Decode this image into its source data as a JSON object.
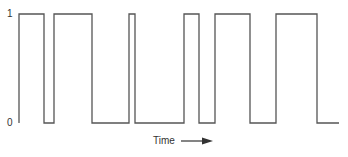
{
  "diagram": {
    "title": "",
    "y_labels": {
      "high": "1",
      "low": "0"
    },
    "x_label": "Time",
    "arrow": "right-arrow",
    "line_color": "#555555",
    "high_y": 14,
    "low_y": 123,
    "start_x": 19,
    "end_x": 339,
    "transitions": [
      {
        "x": 19,
        "to": 1
      },
      {
        "x": 44,
        "to": 0
      },
      {
        "x": 54,
        "to": 1
      },
      {
        "x": 92,
        "to": 0
      },
      {
        "x": 129,
        "to": 1
      },
      {
        "x": 135,
        "to": 0
      },
      {
        "x": 184,
        "to": 1
      },
      {
        "x": 199,
        "to": 0
      },
      {
        "x": 215,
        "to": 1
      },
      {
        "x": 250,
        "to": 0
      },
      {
        "x": 276,
        "to": 1
      },
      {
        "x": 317,
        "to": 0
      }
    ]
  }
}
